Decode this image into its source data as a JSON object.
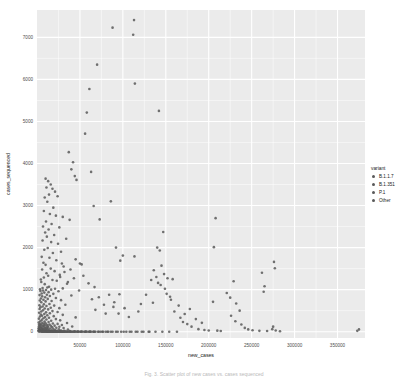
{
  "figure": {
    "caption": "Fig. 3. Scatter plot of new cases vs. cases sequenced"
  },
  "chart_data": {
    "type": "scatter",
    "title": "",
    "xlabel": "new_cases",
    "ylabel": "cases_sequenced",
    "xlim": [
      0,
      382000
    ],
    "ylim": [
      -150,
      7650
    ],
    "xticks": [
      50000,
      100000,
      150000,
      200000,
      250000,
      300000,
      350000
    ],
    "xtick_labels": [
      "50000",
      "100000",
      "150000",
      "200000",
      "250000",
      "300000",
      "350000"
    ],
    "yticks": [
      0,
      1000,
      2000,
      3000,
      4000,
      5000,
      6000,
      7000
    ],
    "ytick_labels": [
      "0",
      "1000",
      "2000",
      "3000",
      "4000",
      "5000",
      "6000",
      "7000"
    ],
    "grid": true,
    "grid_color": "#ffffff",
    "panel_background": "#ebebeb",
    "point_color": "#595959",
    "point_size": 2.6,
    "point_opacity": 0.85,
    "legend": {
      "position": "right",
      "title": "variant",
      "entries": [
        {
          "label": "B.1.1.7",
          "color": "#595959"
        },
        {
          "label": "B.1.351",
          "color": "#595959"
        },
        {
          "label": "P.1",
          "color": "#595959"
        },
        {
          "label": "Other",
          "color": "#595959"
        }
      ]
    },
    "points": [
      [
        113000,
        7410
      ],
      [
        88000,
        7230
      ],
      [
        112000,
        7060
      ],
      [
        70000,
        6350
      ],
      [
        114000,
        5900
      ],
      [
        61000,
        5770
      ],
      [
        58000,
        5210
      ],
      [
        142000,
        5250
      ],
      [
        56000,
        4710
      ],
      [
        37000,
        4270
      ],
      [
        42000,
        4030
      ],
      [
        63000,
        3800
      ],
      [
        40000,
        3860
      ],
      [
        44000,
        3700
      ],
      [
        46000,
        3610
      ],
      [
        10000,
        3640
      ],
      [
        13000,
        3580
      ],
      [
        16000,
        3500
      ],
      [
        11000,
        3430
      ],
      [
        18000,
        3400
      ],
      [
        21000,
        3330
      ],
      [
        14000,
        3260
      ],
      [
        9000,
        3190
      ],
      [
        24000,
        3220
      ],
      [
        86000,
        3100
      ],
      [
        66000,
        2990
      ],
      [
        12000,
        3090
      ],
      [
        19000,
        2950
      ],
      [
        8000,
        2870
      ],
      [
        15000,
        2800
      ],
      [
        22000,
        2760
      ],
      [
        30000,
        2730
      ],
      [
        208000,
        2700
      ],
      [
        73000,
        2670
      ],
      [
        38000,
        2660
      ],
      [
        10500,
        2620
      ],
      [
        17000,
        2560
      ],
      [
        7000,
        2500
      ],
      [
        26000,
        2480
      ],
      [
        13500,
        2430
      ],
      [
        147000,
        2370
      ],
      [
        9500,
        2360
      ],
      [
        20000,
        2300
      ],
      [
        11500,
        2260
      ],
      [
        34000,
        2210
      ],
      [
        6500,
        2170
      ],
      [
        16500,
        2130
      ],
      [
        24500,
        2090
      ],
      [
        206000,
        2010
      ],
      [
        92000,
        2000
      ],
      [
        140000,
        2000
      ],
      [
        12500,
        1990
      ],
      [
        8500,
        1950
      ],
      [
        143000,
        1930
      ],
      [
        28000,
        1900
      ],
      [
        18500,
        1870
      ],
      [
        100000,
        1810
      ],
      [
        113500,
        1790
      ],
      [
        5500,
        1780
      ],
      [
        14500,
        1760
      ],
      [
        45000,
        1720
      ],
      [
        22500,
        1700
      ],
      [
        97000,
        1690
      ],
      [
        276000,
        1660
      ],
      [
        7500,
        1640
      ],
      [
        50000,
        1620
      ],
      [
        52000,
        1600
      ],
      [
        10000,
        1590
      ],
      [
        145000,
        1570
      ],
      [
        31000,
        1550
      ],
      [
        277000,
        1510
      ],
      [
        16000,
        1500
      ],
      [
        6000,
        1480
      ],
      [
        136000,
        1460
      ],
      [
        20500,
        1440
      ],
      [
        262000,
        1400
      ],
      [
        11000,
        1390
      ],
      [
        148000,
        1370
      ],
      [
        26500,
        1350
      ],
      [
        13000,
        1330
      ],
      [
        139000,
        1300
      ],
      [
        8000,
        1290
      ],
      [
        152000,
        1270
      ],
      [
        158000,
        1250
      ],
      [
        4500,
        1240
      ],
      [
        18000,
        1230
      ],
      [
        23000,
        1210
      ],
      [
        229000,
        1200
      ],
      [
        5000,
        1180
      ],
      [
        141000,
        1160
      ],
      [
        35000,
        1140
      ],
      [
        9000,
        1130
      ],
      [
        144000,
        1110
      ],
      [
        265000,
        1080
      ],
      [
        14000,
        1070
      ],
      [
        12000,
        1050
      ],
      [
        6500,
        1040
      ],
      [
        30000,
        1030
      ],
      [
        21000,
        1020
      ],
      [
        3500,
        1010
      ],
      [
        16500,
        1000
      ],
      [
        10500,
        990
      ],
      [
        7000,
        980
      ],
      [
        4000,
        970
      ],
      [
        25000,
        960
      ],
      [
        264000,
        950
      ],
      [
        13500,
        940
      ],
      [
        8500,
        930
      ],
      [
        221000,
        920
      ],
      [
        5500,
        910
      ],
      [
        19000,
        900
      ],
      [
        96000,
        890
      ],
      [
        11500,
        880
      ],
      [
        3000,
        870
      ],
      [
        40000,
        860
      ],
      [
        15000,
        850
      ],
      [
        6000,
        840
      ],
      [
        155000,
        830
      ],
      [
        9500,
        820
      ],
      [
        225000,
        810
      ],
      [
        22000,
        800
      ],
      [
        4500,
        790
      ],
      [
        12500,
        780
      ],
      [
        64000,
        770
      ],
      [
        7500,
        760
      ],
      [
        28000,
        750
      ],
      [
        3200,
        740
      ],
      [
        17000,
        730
      ],
      [
        10000,
        720
      ],
      [
        205000,
        710
      ],
      [
        5000,
        700
      ],
      [
        135000,
        690
      ],
      [
        232000,
        670
      ],
      [
        14500,
        660
      ],
      [
        8000,
        650
      ],
      [
        33000,
        640
      ],
      [
        2800,
        630
      ],
      [
        20000,
        620
      ],
      [
        11000,
        610
      ],
      [
        6500,
        600
      ],
      [
        89000,
        590
      ],
      [
        4000,
        580
      ],
      [
        16000,
        570
      ],
      [
        26000,
        560
      ],
      [
        9000,
        550
      ],
      [
        3000,
        540
      ],
      [
        13000,
        530
      ],
      [
        68000,
        520
      ],
      [
        7000,
        510
      ],
      [
        236000,
        500
      ],
      [
        18000,
        490
      ],
      [
        5000,
        480
      ],
      [
        24000,
        470
      ],
      [
        10500,
        460
      ],
      [
        2500,
        450
      ],
      [
        15000,
        440
      ],
      [
        80000,
        430
      ],
      [
        8500,
        420
      ],
      [
        4500,
        410
      ],
      [
        30000,
        400
      ],
      [
        12000,
        390
      ],
      [
        6000,
        380
      ],
      [
        19500,
        370
      ],
      [
        3500,
        360
      ],
      [
        9500,
        350
      ],
      [
        45000,
        340
      ],
      [
        14000,
        330
      ],
      [
        7500,
        320
      ],
      [
        2200,
        310
      ],
      [
        22000,
        300
      ],
      [
        11000,
        290
      ],
      [
        5500,
        280
      ],
      [
        27000,
        270
      ],
      [
        16500,
        260
      ],
      [
        3800,
        250
      ],
      [
        8800,
        240
      ],
      [
        13500,
        230
      ],
      [
        2000,
        220
      ],
      [
        6300,
        210
      ],
      [
        35000,
        205
      ],
      [
        10000,
        200
      ],
      [
        18500,
        195
      ],
      [
        4200,
        190
      ],
      [
        24000,
        185
      ],
      [
        7800,
        180
      ],
      [
        2600,
        175
      ],
      [
        14500,
        170
      ],
      [
        11500,
        165
      ],
      [
        5200,
        160
      ],
      [
        29000,
        158
      ],
      [
        9200,
        152
      ],
      [
        3300,
        148
      ],
      [
        20500,
        144
      ],
      [
        16000,
        140
      ],
      [
        6800,
        136
      ],
      [
        12500,
        132
      ],
      [
        2400,
        128
      ],
      [
        41000,
        124
      ],
      [
        8200,
        120
      ],
      [
        26000,
        116
      ],
      [
        4800,
        112
      ],
      [
        17500,
        108
      ],
      [
        10800,
        104
      ],
      [
        3100,
        100
      ],
      [
        13000,
        96
      ],
      [
        22500,
        92
      ],
      [
        6000,
        88
      ],
      [
        31000,
        85
      ],
      [
        9000,
        82
      ],
      [
        1900,
        79
      ],
      [
        15500,
        76
      ],
      [
        11000,
        73
      ],
      [
        4400,
        70
      ],
      [
        19000,
        67
      ],
      [
        7200,
        64
      ],
      [
        2700,
        61
      ],
      [
        25500,
        58
      ],
      [
        12000,
        56
      ],
      [
        5600,
        53
      ],
      [
        36000,
        50
      ],
      [
        8600,
        48
      ],
      [
        3600,
        45
      ],
      [
        14000,
        43
      ],
      [
        21000,
        40
      ],
      [
        10000,
        38
      ],
      [
        2100,
        36
      ],
      [
        17000,
        34
      ],
      [
        6400,
        32
      ],
      [
        28000,
        30
      ],
      [
        11800,
        28
      ],
      [
        4000,
        26
      ],
      [
        23000,
        24
      ],
      [
        8000,
        22
      ],
      [
        1700,
        20
      ],
      [
        32000,
        19
      ],
      [
        13000,
        18
      ],
      [
        5000,
        17
      ],
      [
        19500,
        16
      ],
      [
        9500,
        15
      ],
      [
        2900,
        14
      ],
      [
        38000,
        13
      ],
      [
        15000,
        12
      ],
      [
        7000,
        11
      ],
      [
        26500,
        10
      ],
      [
        11000,
        9
      ],
      [
        3400,
        8
      ],
      [
        44000,
        8
      ],
      [
        17500,
        7
      ],
      [
        6000,
        7
      ],
      [
        30000,
        6
      ],
      [
        12500,
        6
      ],
      [
        2300,
        5
      ],
      [
        48000,
        5
      ],
      [
        20000,
        5
      ],
      [
        8400,
        4
      ],
      [
        34000,
        4
      ],
      [
        14500,
        4
      ],
      [
        4600,
        3
      ],
      [
        52000,
        3
      ],
      [
        22000,
        3
      ],
      [
        9800,
        3
      ],
      [
        39000,
        2
      ],
      [
        16000,
        2
      ],
      [
        5400,
        2
      ],
      [
        57000,
        2
      ],
      [
        24500,
        2
      ],
      [
        11500,
        2
      ],
      [
        43000,
        1
      ],
      [
        18000,
        1
      ],
      [
        6600,
        1
      ],
      [
        62000,
        1
      ],
      [
        27000,
        1
      ],
      [
        13000,
        1
      ],
      [
        47000,
        1
      ],
      [
        20500,
        1
      ],
      [
        7600,
        1
      ],
      [
        68000,
        0
      ],
      [
        29500,
        0
      ],
      [
        14000,
        0
      ],
      [
        51000,
        0
      ],
      [
        23000,
        0
      ],
      [
        8800,
        0
      ],
      [
        74000,
        0
      ],
      [
        32000,
        0
      ],
      [
        15500,
        0
      ],
      [
        56000,
        0
      ],
      [
        25500,
        0
      ],
      [
        10200,
        0
      ],
      [
        80000,
        0
      ],
      [
        35000,
        0
      ],
      [
        17000,
        0
      ],
      [
        61000,
        0
      ],
      [
        28000,
        0
      ],
      [
        11500,
        0
      ],
      [
        86000,
        0
      ],
      [
        38000,
        0
      ],
      [
        18500,
        0
      ],
      [
        66000,
        0
      ],
      [
        30500,
        0
      ],
      [
        12800,
        0
      ],
      [
        92000,
        0
      ],
      [
        41000,
        0
      ],
      [
        20000,
        0
      ],
      [
        71000,
        0
      ],
      [
        33000,
        0
      ],
      [
        14200,
        0
      ],
      [
        98000,
        0
      ],
      [
        44000,
        0
      ],
      [
        21500,
        0
      ],
      [
        76000,
        0
      ],
      [
        36000,
        0
      ],
      [
        15800,
        0
      ],
      [
        104000,
        0
      ],
      [
        47500,
        0
      ],
      [
        23000,
        0
      ],
      [
        82000,
        0
      ],
      [
        39000,
        0
      ],
      [
        17200,
        0
      ],
      [
        110000,
        0
      ],
      [
        51000,
        0
      ],
      [
        24500,
        0
      ],
      [
        88000,
        0
      ],
      [
        42000,
        0
      ],
      [
        19000,
        0
      ],
      [
        117000,
        0
      ],
      [
        55000,
        0
      ],
      [
        26000,
        0
      ],
      [
        94000,
        0
      ],
      [
        45500,
        0
      ],
      [
        21000,
        0
      ],
      [
        124000,
        0
      ],
      [
        59000,
        0
      ],
      [
        28000,
        0
      ],
      [
        101000,
        0
      ],
      [
        49000,
        0
      ],
      [
        22500,
        0
      ],
      [
        131000,
        0
      ],
      [
        63000,
        0
      ],
      [
        30000,
        0
      ],
      [
        108000,
        0
      ],
      [
        53000,
        0
      ],
      [
        24000,
        0
      ],
      [
        138000,
        0
      ],
      [
        67000,
        0
      ],
      [
        32000,
        0
      ],
      [
        115000,
        0
      ],
      [
        57000,
        0
      ],
      [
        26000,
        0
      ],
      [
        146000,
        0
      ],
      [
        72000,
        0
      ],
      [
        34500,
        0
      ],
      [
        122000,
        0
      ],
      [
        61000,
        0
      ],
      [
        28500,
        0
      ],
      [
        154000,
        0
      ],
      [
        77000,
        0
      ],
      [
        37000,
        0
      ],
      [
        130000,
        0
      ],
      [
        65500,
        0
      ],
      [
        31000,
        0
      ],
      [
        163000,
        0
      ],
      [
        83000,
        0
      ],
      [
        40000,
        0
      ],
      [
        170000,
        230
      ],
      [
        167000,
        330
      ],
      [
        175000,
        180
      ],
      [
        180000,
        120
      ],
      [
        188000,
        60
      ],
      [
        195000,
        40
      ],
      [
        200000,
        30
      ],
      [
        210000,
        25
      ],
      [
        214000,
        15
      ],
      [
        226000,
        380
      ],
      [
        231000,
        250
      ],
      [
        238000,
        170
      ],
      [
        242000,
        90
      ],
      [
        246000,
        55
      ],
      [
        251000,
        35
      ],
      [
        259000,
        20
      ],
      [
        268000,
        15
      ],
      [
        274000,
        60
      ],
      [
        275000,
        120
      ],
      [
        278000,
        30
      ],
      [
        283000,
        10
      ],
      [
        375000,
        55
      ],
      [
        373000,
        20
      ],
      [
        160000,
        480
      ],
      [
        165000,
        620
      ],
      [
        172000,
        420
      ],
      [
        178000,
        540
      ],
      [
        185000,
        300
      ],
      [
        192000,
        210
      ],
      [
        156000,
        760
      ],
      [
        151000,
        900
      ],
      [
        149000,
        1020
      ],
      [
        133000,
        1230
      ],
      [
        127000,
        880
      ],
      [
        121000,
        660
      ],
      [
        118000,
        480
      ],
      [
        107000,
        350
      ],
      [
        102000,
        560
      ],
      [
        95000,
        430
      ],
      [
        90000,
        700
      ],
      [
        84000,
        880
      ],
      [
        78000,
        640
      ],
      [
        72000,
        820
      ],
      [
        67000,
        1060
      ],
      [
        60000,
        1150
      ],
      [
        54000,
        1330
      ],
      [
        49000,
        980
      ],
      [
        43000,
        1270
      ],
      [
        39000,
        1480
      ],
      [
        36000,
        1180
      ],
      [
        32000,
        1420
      ],
      [
        29000,
        1620
      ],
      [
        27000,
        1300
      ]
    ]
  }
}
